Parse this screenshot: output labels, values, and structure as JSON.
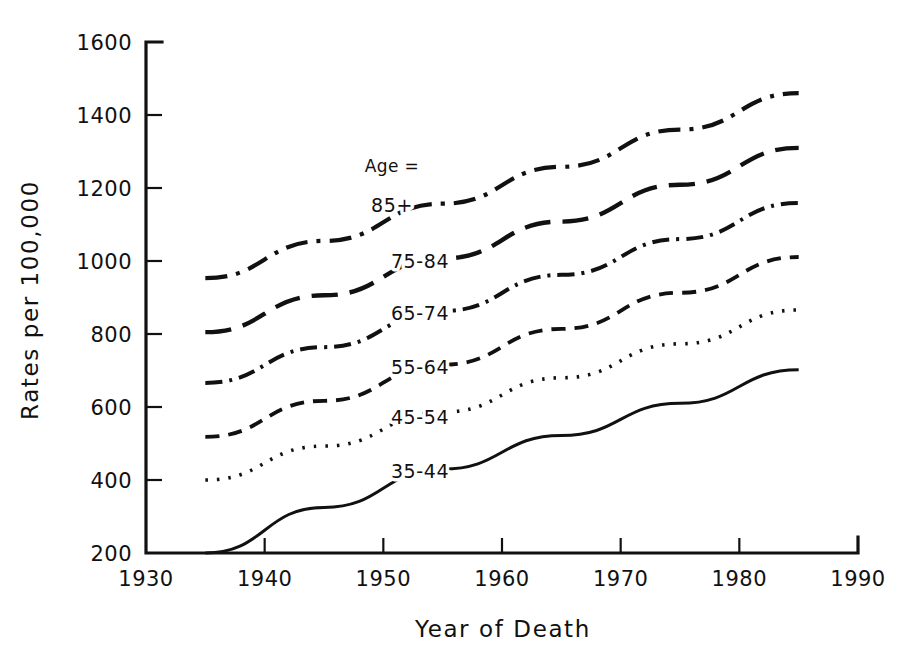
{
  "chart_data": {
    "type": "line",
    "title": "",
    "xlabel": "Year of Death",
    "ylabel": "Rates per 100,000",
    "xlim": [
      1930,
      1990
    ],
    "ylim": [
      200,
      1600
    ],
    "xticks": [
      1930,
      1940,
      1950,
      1960,
      1970,
      1980,
      1990
    ],
    "yticks": [
      200,
      400,
      600,
      800,
      1000,
      1200,
      1400,
      1600
    ],
    "xtick_labels": [
      "1930",
      "1940",
      "1950",
      "1960",
      "1970",
      "1980",
      "1990"
    ],
    "ytick_labels": [
      "200",
      "400",
      "600",
      "800",
      "1000",
      "1200",
      "1400",
      "1600"
    ],
    "grid": false,
    "legend_position": "inline-labels",
    "legend_title": "Age =",
    "x": [
      1935,
      1945,
      1955,
      1965,
      1975,
      1985
    ],
    "series": [
      {
        "name": "85+",
        "label": "85+",
        "style": "dashdot",
        "dasharray": "22 9 4 9",
        "width": 4.2,
        "values": [
          953,
          1055,
          1157,
          1258,
          1360,
          1460
        ]
      },
      {
        "name": "75-84",
        "label": "75-84",
        "style": "longdash",
        "dasharray": "26 12",
        "width": 4.4,
        "values": [
          805,
          906,
          1007,
          1108,
          1209,
          1310
        ]
      },
      {
        "name": "65-74",
        "label": "65-74",
        "style": "dashdot-short",
        "dasharray": "17 7 3 7",
        "width": 4.0,
        "values": [
          666,
          764,
          863,
          962,
          1060,
          1159
        ]
      },
      {
        "name": "55-64",
        "label": "55-64",
        "style": "dash",
        "dasharray": "14 9",
        "width": 3.8,
        "values": [
          518,
          617,
          716,
          814,
          913,
          1011
        ]
      },
      {
        "name": "45-54",
        "label": "45-54",
        "style": "dotted",
        "dasharray": "2.5 9",
        "width": 3.6,
        "values": [
          400,
          493,
          586,
          680,
          773,
          866
        ]
      },
      {
        "name": "35-44",
        "label": "35-44",
        "style": "solid",
        "dasharray": "none",
        "width": 3.0,
        "values": [
          200,
          325,
          430,
          522,
          610,
          702
        ]
      }
    ]
  },
  "colors": {
    "ink": "#111111",
    "background": "#ffffff"
  }
}
